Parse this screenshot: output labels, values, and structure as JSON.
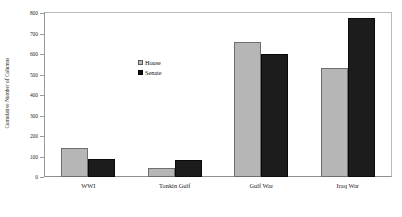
{
  "chart_data": {
    "type": "bar",
    "title": "",
    "subtitle": "",
    "xlabel": "",
    "ylabel": "Cumulative Number of Columns",
    "categories": [
      "WWI",
      "Tonkin Gulf",
      "Gulf War",
      "Iraq War"
    ],
    "series": [
      {
        "name": "House",
        "color": "#b6b6b6",
        "values": [
          140,
          45,
          660,
          530
        ]
      },
      {
        "name": "Senate",
        "color": "#1c1c1c",
        "values": [
          90,
          85,
          600,
          775
        ]
      }
    ],
    "ylim": [
      0,
      800
    ],
    "yticks": [
      0,
      100,
      200,
      300,
      400,
      500,
      600,
      700,
      800
    ],
    "ytick_labels": [
      "0",
      "100",
      "200",
      "300",
      "400",
      "500",
      "600",
      "700",
      "800"
    ],
    "grid": false,
    "legend_position": "inside-upper-center",
    "legend_entries": [
      "House",
      "Senate"
    ],
    "frame": true
  },
  "axis": {
    "y_title": "Cumulative Number of Columns"
  },
  "icons": {
    "house_swatch": "filled-square-light-gray",
    "senate_swatch": "filled-square-black"
  }
}
